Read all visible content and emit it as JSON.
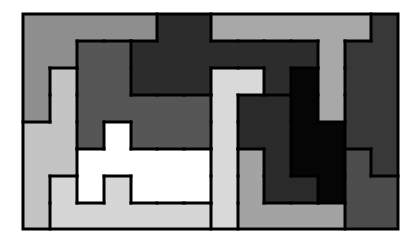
{
  "puzzle": {
    "grid": {
      "cols": 14,
      "rows": 8,
      "x_bounds": [
        23,
        50,
        77,
        104,
        131,
        157,
        184,
        211,
        238,
        264,
        291,
        318,
        345,
        371,
        398
      ],
      "y_bounds": [
        14,
        41,
        68,
        95,
        122,
        149,
        176,
        203,
        229
      ]
    },
    "pieces": {
      "A": {
        "name": "medium-gray-piece",
        "color": "#8e8e8e"
      },
      "B": {
        "name": "charcoal-piece",
        "color": "#2c2c2c"
      },
      "C": {
        "name": "silver-t-piece",
        "color": "#a8a8a8"
      },
      "D": {
        "name": "dark-right-piece",
        "color": "#383838"
      },
      "E": {
        "name": "slate-piece",
        "color": "#565656"
      },
      "F": {
        "name": "pale-left-piece",
        "color": "#c4c4c4"
      },
      "G": {
        "name": "light-vertical-piece",
        "color": "#d9d9d9"
      },
      "H": {
        "name": "black-piece",
        "color": "#050505"
      },
      "I": {
        "name": "dark-center-piece",
        "color": "#2a2a2a"
      },
      "J": {
        "name": "gray-bottom-piece",
        "color": "#a3a3a3"
      },
      "K": {
        "name": "dark-gray-corner-piece",
        "color": "#4c4c4c"
      },
      "L": {
        "name": "light-bottom-piece",
        "color": "#d6d6d6"
      },
      "W": {
        "name": "white-piece",
        "color": "#ffffff"
      }
    },
    "layout": [
      "AAAAABBCCCCCCD",
      "AAEEBBBBBBBCDD",
      "AFEEBBBGGBHCDD",
      "AFEEEEEGIIHCDD",
      "FFEWEEEGIIHHDD",
      "FFWWWWWGJIHHKD",
      "FLWLWWWGJIIHKK",
      "FLLLLLLGJJJJKK"
    ],
    "border_color": "#000000"
  }
}
